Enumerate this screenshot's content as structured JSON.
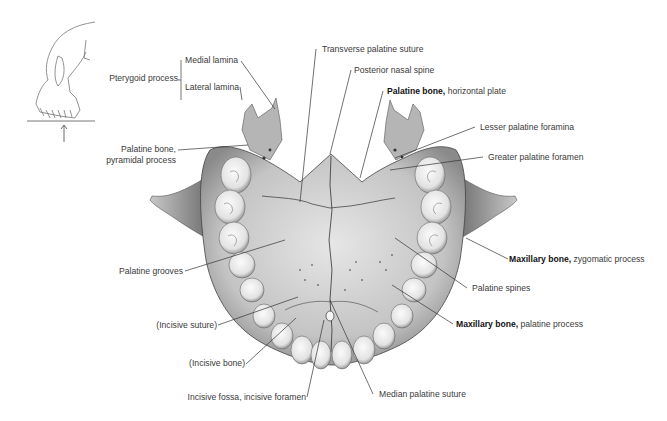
{
  "figure": {
    "orientation_inset": {
      "icon": "skull-lateral-outline-with-upward-arrow"
    }
  },
  "labels": {
    "pterygoid_process": "Pterygoid process",
    "medial_lamina": "Medial lamina",
    "lateral_lamina": "Lateral lamina",
    "palatine_pyramidal_1": "Palatine bone,",
    "palatine_pyramidal_2": "pyramidal process",
    "palatine_grooves": "Palatine grooves",
    "incisive_suture": "(Incisive suture)",
    "incisive_bone": "(Incisive bone)",
    "incisive_fossa": "Incisive fossa, incisive foramen",
    "transverse_palatine_suture": "Transverse palatine suture",
    "posterior_nasal_spine": "Posterior nasal spine",
    "palatine_horizontal_bold": "Palatine bone,",
    "palatine_horizontal_rest": " horizontal plate",
    "lesser_palatine_foramina": "Lesser palatine foramina",
    "greater_palatine_foramen": "Greater palatine foramen",
    "maxillary_zygomatic_bold": "Maxillary bone,",
    "maxillary_zygomatic_rest": " zygomatic process",
    "palatine_spines": "Palatine spines",
    "maxillary_palatine_bold": "Maxillary bone,",
    "maxillary_palatine_rest": " palatine process",
    "median_palatine_suture": "Median palatine suture"
  }
}
